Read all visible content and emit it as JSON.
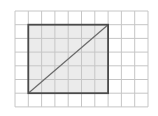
{
  "diagram": {
    "type": "grid-rectangle-with-diagonal",
    "grid": {
      "origin_x": 15,
      "origin_y": 11,
      "cols": 10,
      "rows": 7,
      "cell_w": 13.3,
      "cell_h": 13.7,
      "line_color": "#c6c6c6"
    },
    "rectangle": {
      "col_start": 1,
      "row_start": 1,
      "col_end": 7,
      "row_end": 6,
      "fill": "#ebebeb",
      "stroke": "#4a4a4a"
    },
    "diagonal": {
      "from": "bottom-left",
      "to": "top-right",
      "stroke": "#6a6a6a"
    }
  }
}
